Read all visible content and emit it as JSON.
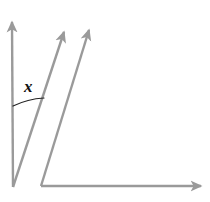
{
  "figure": {
    "type": "geometry-diagram",
    "canvas": {
      "width": 210,
      "height": 202,
      "background": "#ffffff"
    },
    "colors": {
      "ray_stroke": "#9a9a9a",
      "arc_stroke": "#222222",
      "label_text": "#111111",
      "background": "#ffffff"
    },
    "stroke_width": 2.4,
    "vertex": {
      "x": 13,
      "y": 187
    },
    "rays": [
      {
        "name": "vertical-ray",
        "label": "vertical ray",
        "from": {
          "x": 13,
          "y": 187
        },
        "to": {
          "x": 12,
          "y": 22
        },
        "arrowhead": true
      },
      {
        "name": "first-transversal-ray",
        "label": "first transversal ray",
        "from": {
          "x": 13,
          "y": 187
        },
        "to": {
          "x": 64,
          "y": 32
        },
        "arrowhead": true
      },
      {
        "name": "second-transversal-ray",
        "label": "second transversal ray",
        "from": {
          "x": 41,
          "y": 186
        },
        "to": {
          "x": 89,
          "y": 30
        },
        "arrowhead": true
      },
      {
        "name": "horizontal-ray",
        "label": "horizontal ray",
        "from": {
          "x": 41,
          "y": 186
        },
        "to": {
          "x": 201,
          "y": 186
        },
        "arrowhead": true
      }
    ],
    "arc": {
      "name": "angle-arc",
      "start": {
        "x": 13,
        "y": 106
      },
      "end": {
        "x": 44,
        "y": 98
      },
      "radius": 82,
      "stroke_width": 1.2
    },
    "labels": [
      {
        "name": "angle-label-x",
        "text": "x",
        "x": 24,
        "y": 78
      }
    ]
  }
}
